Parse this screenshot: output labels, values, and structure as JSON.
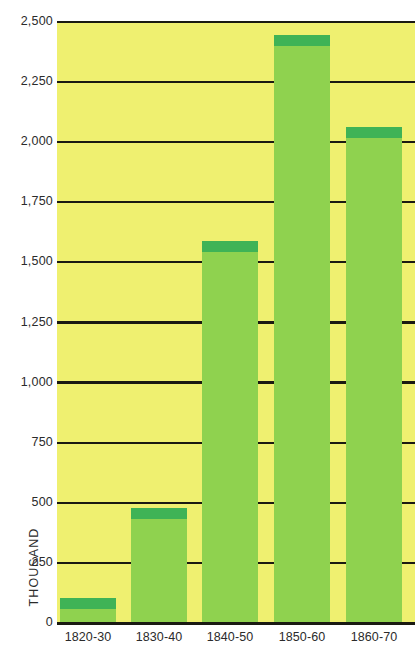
{
  "chart_data": {
    "type": "bar",
    "title": "",
    "subtitle": "",
    "xlabel": "",
    "ylabel": "THOUSAND",
    "categories": [
      "1820-30",
      "1830-40",
      "1840-50",
      "1850-60",
      "1860-70"
    ],
    "values": [
      100,
      475,
      1585,
      2440,
      2060
    ],
    "ylim": [
      0,
      2500
    ],
    "ytick_values": [
      0,
      250,
      500,
      750,
      1000,
      1250,
      1500,
      1750,
      2000,
      2250,
      2500
    ],
    "ytick_labels": [
      "0",
      "250",
      "500",
      "750",
      "1,000",
      "1,250",
      "1,500",
      "1,750",
      "2,000",
      "2,250",
      "2,500"
    ],
    "grid": true,
    "grid_orientation": "horizontal",
    "legend": false,
    "legend_position": "none",
    "series": [
      {
        "name": "Immigration",
        "values": [
          100,
          475,
          1585,
          2440,
          2060
        ]
      }
    ],
    "colors": {
      "plot_background": "#eff070",
      "bar_fill": "#8fd24f",
      "bar_cap": "#3fb356",
      "gridline": "#1a1a12",
      "text": "#2b2b2b",
      "page_background": "#ffffff"
    }
  },
  "axis": {
    "y_title": "THOUSAND"
  }
}
